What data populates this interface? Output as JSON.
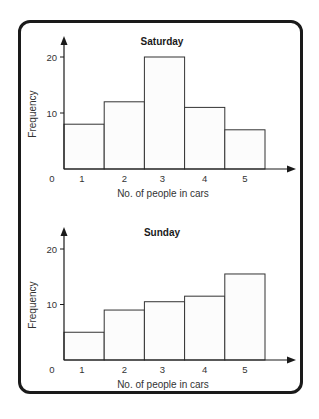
{
  "chart_data": [
    {
      "type": "bar",
      "title": "Saturday",
      "xlabel": "No. of people in cars",
      "ylabel": "Frequency",
      "categories": [
        "1",
        "2",
        "3",
        "4",
        "5"
      ],
      "values": [
        8,
        12,
        20,
        11,
        7
      ],
      "y_ticks": [
        "0",
        "10",
        "20"
      ],
      "ylim": [
        0,
        22
      ],
      "grid": false,
      "legend": null
    },
    {
      "type": "bar",
      "title": "Sunday",
      "xlabel": "No. of people in cars",
      "ylabel": "Frequency",
      "categories": [
        "1",
        "2",
        "3",
        "4",
        "5"
      ],
      "values": [
        5,
        9,
        10.5,
        11.5,
        15.5
      ],
      "y_ticks": [
        "0",
        "10",
        "20"
      ],
      "ylim": [
        0,
        22
      ],
      "grid": false,
      "legend": null
    }
  ],
  "colors": {
    "frame": "#1a1a1a",
    "axis": "#1a1a1a",
    "bar_fill": "#fcfcfc",
    "bar_stroke": "#333333",
    "text": "#333333"
  }
}
